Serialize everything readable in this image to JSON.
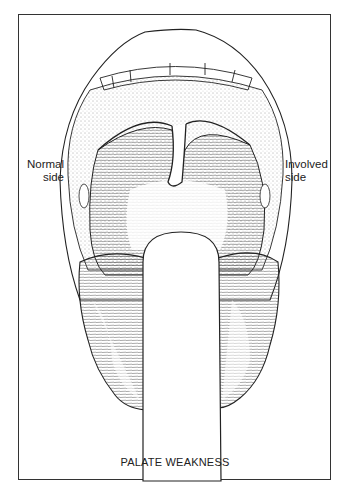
{
  "figure": {
    "caption": "PALATE WEAKNESS",
    "labels": {
      "left": {
        "line1": "Normal",
        "line2": "side"
      },
      "right": {
        "line1": "Involved",
        "line2": "side"
      }
    },
    "illustration": "open-mouth-with-tongue-depressor",
    "colors": {
      "line": "#222222",
      "background": "#ffffff",
      "frame": "#333333"
    }
  }
}
